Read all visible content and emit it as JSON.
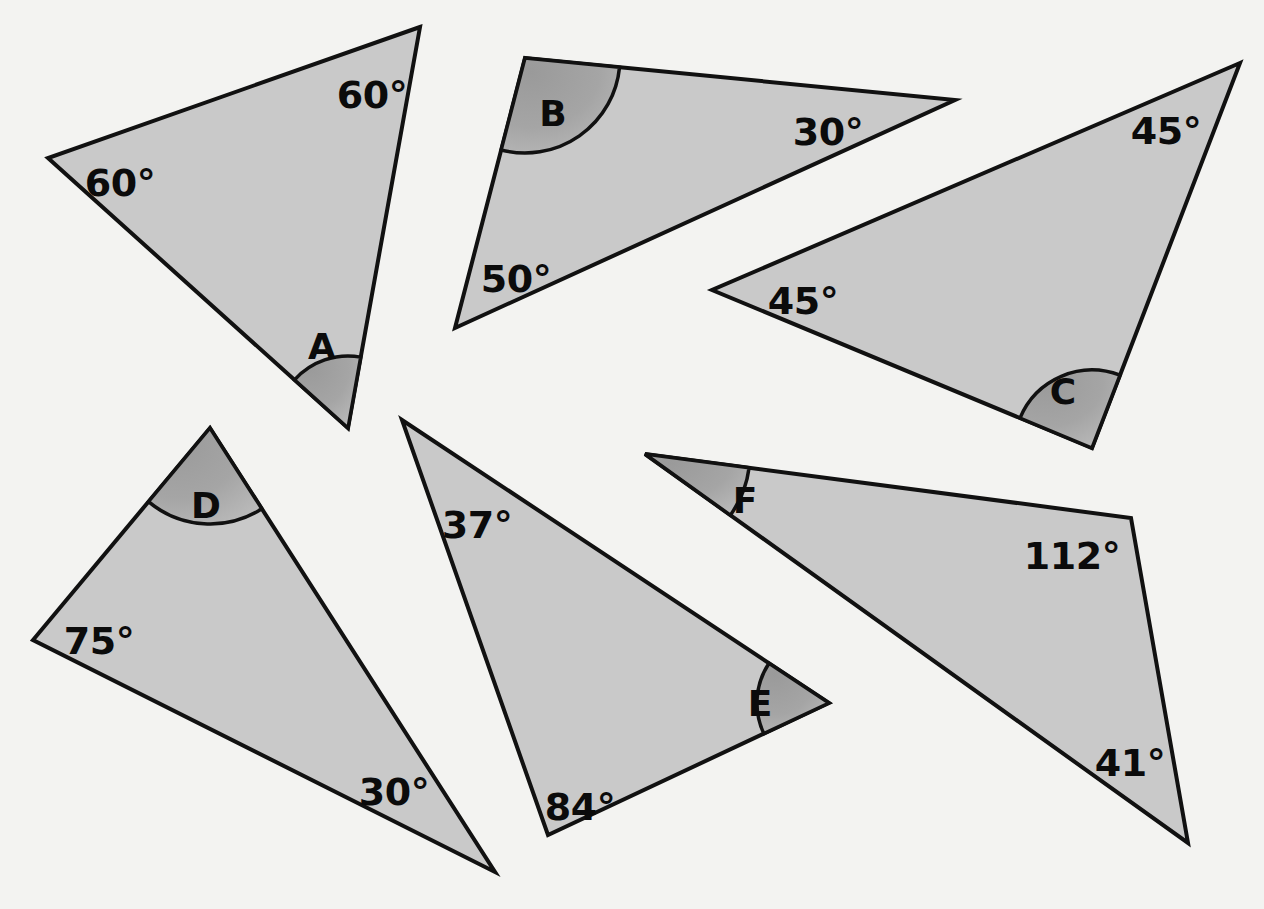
{
  "page": {
    "background_color": "#f3f3f1",
    "figure_type": "geometry-worksheet"
  },
  "style": {
    "triangle_fill": "#c9c9c9",
    "triangle_stroke": "#111111",
    "arc_fill_light": "#b0b0b0",
    "arc_fill_dark": "#8f8f8f",
    "label_color": "#0b0b0b"
  },
  "chart_data": {
    "type": "diagram",
    "title": "",
    "shapes": [
      {
        "id": "A",
        "name": "triangle-a",
        "vertices": [
          [
            420,
            27
          ],
          [
            48,
            158
          ],
          [
            348,
            428
          ]
        ],
        "marked_vertex_index": 2,
        "marked_vertex_label": "A",
        "marked_vertex_label_pos": [
          322,
          349
        ],
        "arc_radius": 72,
        "angles": [
          {
            "text": "60°",
            "x": 372,
            "y": 97
          },
          {
            "text": "60°",
            "x": 120,
            "y": 185
          },
          {
            "text": "A",
            "x": 322,
            "y": 349
          }
        ]
      },
      {
        "id": "B",
        "name": "triangle-b",
        "vertices": [
          [
            525,
            58
          ],
          [
            955,
            100
          ],
          [
            455,
            328
          ]
        ],
        "marked_vertex_index": 0,
        "marked_vertex_label": "B",
        "marked_vertex_label_pos": [
          553,
          116
        ],
        "arc_radius": 95,
        "angles": [
          {
            "text": "B",
            "x": 553,
            "y": 116
          },
          {
            "text": "30°",
            "x": 828,
            "y": 134
          },
          {
            "text": "50°",
            "x": 516,
            "y": 281
          }
        ]
      },
      {
        "id": "C",
        "name": "triangle-c",
        "vertices": [
          [
            1240,
            63
          ],
          [
            712,
            290
          ],
          [
            1092,
            448
          ]
        ],
        "marked_vertex_index": 2,
        "marked_vertex_label": "C",
        "marked_vertex_label_pos": [
          1063,
          394
        ],
        "arc_radius": 78,
        "angles": [
          {
            "text": "45°",
            "x": 1166,
            "y": 133
          },
          {
            "text": "45°",
            "x": 803,
            "y": 303
          },
          {
            "text": "C",
            "x": 1063,
            "y": 394
          }
        ]
      },
      {
        "id": "D",
        "name": "triangle-d",
        "vertices": [
          [
            210,
            428
          ],
          [
            33,
            640
          ],
          [
            495,
            872
          ]
        ],
        "marked_vertex_index": 0,
        "marked_vertex_label": "D",
        "marked_vertex_label_pos": [
          206,
          508
        ],
        "arc_radius": 96,
        "angles": [
          {
            "text": "D",
            "x": 206,
            "y": 508
          },
          {
            "text": "75°",
            "x": 99,
            "y": 643
          },
          {
            "text": "30°",
            "x": 394,
            "y": 794
          }
        ]
      },
      {
        "id": "E",
        "name": "triangle-e",
        "vertices": [
          [
            402,
            420
          ],
          [
            829,
            703
          ],
          [
            548,
            835
          ]
        ],
        "marked_vertex_index": 1,
        "marked_vertex_label": "E",
        "marked_vertex_label_pos": [
          760,
          706
        ],
        "arc_radius": 72,
        "angles": [
          {
            "text": "37°",
            "x": 477,
            "y": 527
          },
          {
            "text": "E",
            "x": 760,
            "y": 706
          },
          {
            "text": "84°",
            "x": 580,
            "y": 809
          }
        ]
      },
      {
        "id": "F",
        "name": "triangle-f",
        "vertices": [
          [
            645,
            454
          ],
          [
            1131,
            518
          ],
          [
            1188,
            843
          ]
        ],
        "marked_vertex_index": 0,
        "marked_vertex_label": "F",
        "marked_vertex_label_pos": [
          745,
          503
        ],
        "arc_radius": 105,
        "angles": [
          {
            "text": "F",
            "x": 745,
            "y": 503
          },
          {
            "text": "112°",
            "x": 1072,
            "y": 558
          },
          {
            "text": "41°",
            "x": 1130,
            "y": 765
          }
        ]
      }
    ]
  }
}
